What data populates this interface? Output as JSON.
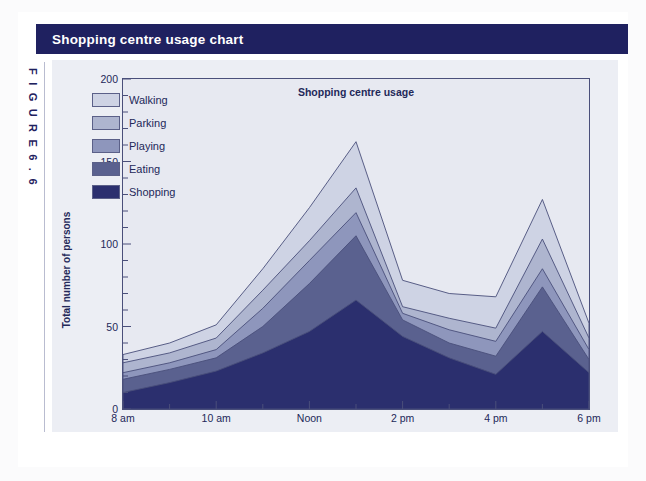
{
  "page": {
    "header_title": "Shopping centre usage chart",
    "figure_label": "F I G U R E   6 . 6",
    "accent_navy": "#1f2160",
    "panel_bg": "#eceef4",
    "plot_bg": "#e7e9f1"
  },
  "legend": {
    "position": "upper-left-inside",
    "items": [
      {
        "label": "Walking",
        "color": "#ced3e4"
      },
      {
        "label": "Parking",
        "color": "#aeb5cf"
      },
      {
        "label": "Playing",
        "color": "#8e96bc"
      },
      {
        "label": "Eating",
        "color": "#5a618f"
      },
      {
        "label": "Shopping",
        "color": "#2b2f6e"
      }
    ]
  },
  "chart_data": {
    "type": "area",
    "stacked": true,
    "title": "Shopping centre usage",
    "xlabel": "Time",
    "ylabel": "Total number of persons",
    "ylim": [
      0,
      200
    ],
    "yticks": [
      0,
      50,
      100,
      150,
      200
    ],
    "yticks_minor_step": 10,
    "grid": false,
    "categories": [
      "8 am",
      "9 am",
      "10 am",
      "11 am",
      "Noon",
      "1 pm",
      "2 pm",
      "3 pm",
      "4 pm",
      "5 pm",
      "6 pm"
    ],
    "x_tick_labels": [
      "8 am",
      "10 am",
      "Noon",
      "2 pm",
      "4 pm",
      "6 pm"
    ],
    "x_tick_indices": [
      0,
      2,
      4,
      6,
      8,
      10
    ],
    "series": [
      {
        "name": "Shopping",
        "color": "#2b2f6e",
        "values": [
          10,
          16,
          23,
          34,
          47,
          66,
          44,
          31,
          21,
          47,
          22
        ]
      },
      {
        "name": "Eating",
        "color": "#5a618f",
        "values": [
          18,
          24,
          31,
          50,
          76,
          105,
          54,
          40,
          32,
          74,
          30
        ]
      },
      {
        "name": "Playing",
        "color": "#8e96bc",
        "values": [
          22,
          28,
          36,
          61,
          90,
          119,
          58,
          48,
          41,
          85,
          36
        ]
      },
      {
        "name": "Parking",
        "color": "#aeb5cf",
        "values": [
          28,
          34,
          43,
          72,
          102,
          134,
          62,
          55,
          49,
          103,
          43
        ]
      },
      {
        "name": "Walking",
        "color": "#ced3e4",
        "values": [
          33,
          40,
          51,
          85,
          122,
          162,
          78,
          70,
          68,
          127,
          52
        ]
      }
    ],
    "totals": [
      33,
      40,
      51,
      85,
      122,
      162,
      78,
      70,
      68,
      127,
      52
    ]
  }
}
